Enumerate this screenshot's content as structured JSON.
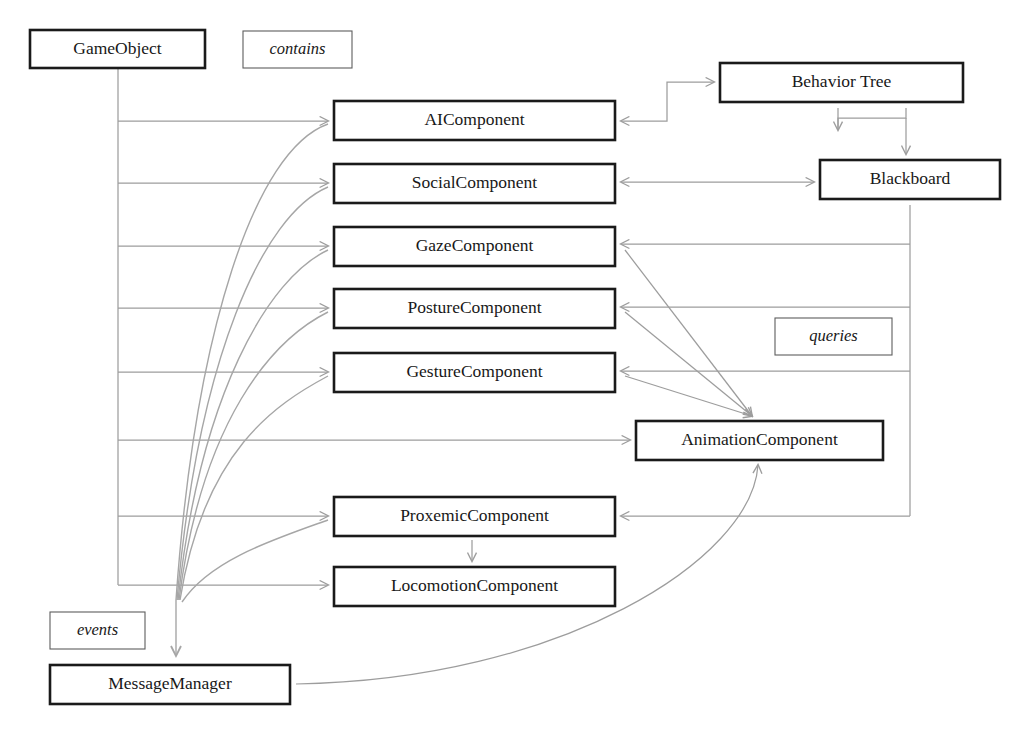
{
  "diagram": {
    "style": {
      "box_border": "#1a1a1a",
      "legend_border": "#5d5d5d",
      "edge_color": "#9d9d9d",
      "background": "#ffffff",
      "text_color": "#181818"
    },
    "nodes": [
      {
        "id": "gameobject",
        "label": "GameObject",
        "x": 30,
        "y": 30,
        "w": 175,
        "h": 38
      },
      {
        "id": "aicomponent",
        "label": "AIComponent",
        "x": 334,
        "y": 101,
        "w": 281,
        "h": 39
      },
      {
        "id": "socialcomponent",
        "label": "SocialComponent",
        "x": 334,
        "y": 164,
        "w": 281,
        "h": 39
      },
      {
        "id": "gazecomponent",
        "label": "GazeComponent",
        "x": 334,
        "y": 227,
        "w": 281,
        "h": 39
      },
      {
        "id": "posturecomponent",
        "label": "PostureComponent",
        "x": 334,
        "y": 289,
        "w": 281,
        "h": 39
      },
      {
        "id": "gesturecomponent",
        "label": "GestureComponent",
        "x": 334,
        "y": 353,
        "w": 281,
        "h": 39
      },
      {
        "id": "proxemiccomponent",
        "label": "ProxemicComponent",
        "x": 334,
        "y": 497,
        "w": 281,
        "h": 39
      },
      {
        "id": "locomotioncomponent",
        "label": "LocomotionComponent",
        "x": 334,
        "y": 567,
        "w": 281,
        "h": 39
      },
      {
        "id": "behaviortree",
        "label": "Behavior Tree",
        "x": 720,
        "y": 63,
        "w": 243,
        "h": 39
      },
      {
        "id": "blackboard",
        "label": "Blackboard",
        "x": 820,
        "y": 160,
        "w": 180,
        "h": 39
      },
      {
        "id": "animationcomponent",
        "label": "AnimationComponent",
        "x": 636,
        "y": 421,
        "w": 247,
        "h": 39
      },
      {
        "id": "messagemanager",
        "label": "MessageManager",
        "x": 50,
        "y": 665,
        "w": 240,
        "h": 39
      }
    ],
    "legends": [
      {
        "id": "contains",
        "label": "contains",
        "x": 243,
        "y": 31,
        "w": 109,
        "h": 37
      },
      {
        "id": "queries",
        "label": "queries",
        "x": 775,
        "y": 318,
        "w": 117,
        "h": 37
      },
      {
        "id": "events",
        "label": "events",
        "x": 50,
        "y": 612,
        "w": 95,
        "h": 37
      }
    ],
    "edges": [
      {
        "id": "gameobject-to-aicomponent",
        "from": "gameobject",
        "to": "aicomponent",
        "relation": "contains",
        "arrow": "single"
      },
      {
        "id": "gameobject-to-socialcomponent",
        "from": "gameobject",
        "to": "socialcomponent",
        "relation": "contains",
        "arrow": "single"
      },
      {
        "id": "gameobject-to-gazecomponent",
        "from": "gameobject",
        "to": "gazecomponent",
        "relation": "contains",
        "arrow": "single"
      },
      {
        "id": "gameobject-to-posturecomponent",
        "from": "gameobject",
        "to": "posturecomponent",
        "relation": "contains",
        "arrow": "single"
      },
      {
        "id": "gameobject-to-gesturecomponent",
        "from": "gameobject",
        "to": "gesturecomponent",
        "relation": "contains",
        "arrow": "single"
      },
      {
        "id": "gameobject-to-animationcomponent",
        "from": "gameobject",
        "to": "animationcomponent",
        "relation": "contains",
        "arrow": "single"
      },
      {
        "id": "gameobject-to-proxemiccomponent",
        "from": "gameobject",
        "to": "proxemiccomponent",
        "relation": "contains",
        "arrow": "single"
      },
      {
        "id": "gameobject-to-locomotioncomponent",
        "from": "gameobject",
        "to": "locomotioncomponent",
        "relation": "contains",
        "arrow": "single"
      },
      {
        "id": "aicomponent-to-behaviortree",
        "from": "aicomponent",
        "to": "behaviortree",
        "relation": "queries",
        "arrow": "double"
      },
      {
        "id": "behaviortree-to-blackboard",
        "from": "behaviortree",
        "to": "blackboard",
        "relation": "queries",
        "arrow": "double"
      },
      {
        "id": "socialcomponent-to-blackboard",
        "from": "socialcomponent",
        "to": "blackboard",
        "relation": "queries",
        "arrow": "double"
      },
      {
        "id": "blackboard-to-gazecomponent",
        "from": "blackboard",
        "to": "gazecomponent",
        "relation": "queries",
        "arrow": "single"
      },
      {
        "id": "blackboard-to-posturecomponent",
        "from": "blackboard",
        "to": "posturecomponent",
        "relation": "queries",
        "arrow": "single"
      },
      {
        "id": "blackboard-to-gesturecomponent",
        "from": "blackboard",
        "to": "gesturecomponent",
        "relation": "queries",
        "arrow": "single"
      },
      {
        "id": "blackboard-to-proxemiccomponent",
        "from": "blackboard",
        "to": "proxemiccomponent",
        "relation": "queries",
        "arrow": "single"
      },
      {
        "id": "animationcomponent-to-gazecomponent",
        "from": "animationcomponent",
        "to": "gazecomponent",
        "relation": "queries",
        "arrow": "single"
      },
      {
        "id": "animationcomponent-to-posturecomponent",
        "from": "animationcomponent",
        "to": "posturecomponent",
        "relation": "queries",
        "arrow": "single"
      },
      {
        "id": "animationcomponent-to-gesturecomponent",
        "from": "animationcomponent",
        "to": "gesturecomponent",
        "relation": "queries",
        "arrow": "single"
      },
      {
        "id": "proxemiccomponent-to-locomotioncomponent",
        "from": "proxemiccomponent",
        "to": "locomotioncomponent",
        "relation": "queries",
        "arrow": "single"
      },
      {
        "id": "aicomponent-to-messagemanager",
        "from": "aicomponent",
        "to": "messagemanager",
        "relation": "events",
        "arrow": "single"
      },
      {
        "id": "socialcomponent-to-messagemanager",
        "from": "socialcomponent",
        "to": "messagemanager",
        "relation": "events",
        "arrow": "single"
      },
      {
        "id": "gazecomponent-to-messagemanager",
        "from": "gazecomponent",
        "to": "messagemanager",
        "relation": "events",
        "arrow": "single"
      },
      {
        "id": "posturecomponent-to-messagemanager",
        "from": "posturecomponent",
        "to": "messagemanager",
        "relation": "events",
        "arrow": "single"
      },
      {
        "id": "gesturecomponent-to-messagemanager",
        "from": "gesturecomponent",
        "to": "messagemanager",
        "relation": "events",
        "arrow": "single"
      },
      {
        "id": "proxemiccomponent-to-messagemanager",
        "from": "proxemiccomponent",
        "to": "messagemanager",
        "relation": "events",
        "arrow": "single"
      },
      {
        "id": "animationcomponent-to-messagemanager",
        "from": "animationcomponent",
        "to": "messagemanager",
        "relation": "events",
        "arrow": "single"
      }
    ]
  }
}
